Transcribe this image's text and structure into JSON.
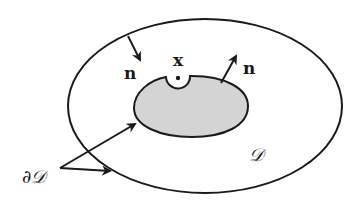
{
  "diagram": {
    "type": "domain-boundary-illustration",
    "colors": {
      "stroke": "#1a1a1a",
      "inner_fill": "#d4d4d4",
      "background": "#ffffff"
    },
    "labels": {
      "point": "x",
      "normal_outer": "n",
      "normal_inner": "n",
      "domain": "𝒟",
      "boundary": "∂𝒟"
    },
    "elements": {
      "outer_boundary": "outer ellipse",
      "inner_region": "gray inner region with notch around point x",
      "normal_arrow_outer": "inward-pointing normal on outer boundary",
      "normal_arrow_inner": "outward normal on inner region",
      "boundary_pointer_arrows": "two arrows from ∂𝒟 label to both boundaries"
    }
  }
}
